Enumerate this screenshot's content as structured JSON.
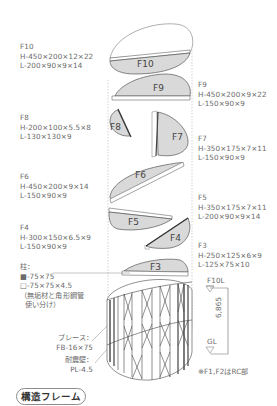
{
  "floors": {
    "f10": {
      "name": "F10",
      "lines": [
        "H-450×200×12×22",
        "L-200×90×9×14"
      ]
    },
    "f9": {
      "name": "F9",
      "lines": [
        "H-450×200×9×22",
        "L-150×90×9"
      ]
    },
    "f8": {
      "name": "F8",
      "lines": [
        "H-200×100×5.5×8",
        "L-130×130×9"
      ]
    },
    "f7": {
      "name": "F7",
      "lines": [
        "H-350×175×7×11",
        "L-150×90×9"
      ]
    },
    "f6": {
      "name": "F6",
      "lines": [
        "H-450×200×9×14",
        "L-150×90×9"
      ]
    },
    "f5": {
      "name": "F5",
      "lines": [
        "H-350×175×7×11",
        "L-200×90×9×14"
      ]
    },
    "f4": {
      "name": "F4",
      "lines": [
        "H-300×150×6.5×9",
        "L-150×90×9"
      ]
    },
    "f3": {
      "name": "F3",
      "lines": [
        "H-250×125×6×9",
        "L-125×75×10"
      ]
    }
  },
  "shape_labels": [
    "F10",
    "F9",
    "F8",
    "F7",
    "F6",
    "F5",
    "F4",
    "F3"
  ],
  "column": {
    "heading": "柱：",
    "solid": "■-75×75",
    "hollow": "□-75×75×4.5",
    "note1": "（無垢材と角形鋼管",
    "note2": "使い分け）"
  },
  "brace": {
    "label": "ブレース：",
    "spec": "FB-16×75"
  },
  "wall": {
    "label": "耐震壁：",
    "spec": "PL-4.5"
  },
  "dimension": {
    "top": "F10L",
    "bottom": "GL",
    "value": "6,865"
  },
  "note": "※F1,F2はRC部",
  "title": "構造フレーム",
  "colors": {
    "fill": "#d9d9d9",
    "stroke": "#555555",
    "text": "#6b6b6b",
    "dash": "#aaaaaa"
  }
}
